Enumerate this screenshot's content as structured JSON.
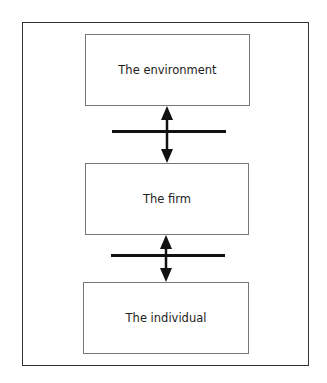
{
  "diagram": {
    "boxes": [
      {
        "label": "The environment"
      },
      {
        "label": "The firm"
      },
      {
        "label": "The individual"
      }
    ],
    "connectors": [
      {
        "from": "The environment",
        "to": "The firm",
        "type": "bidirectional-arrow-with-barrier"
      },
      {
        "from": "The firm",
        "to": "The individual",
        "type": "bidirectional-arrow-with-barrier"
      }
    ],
    "colors": {
      "frame": "#333333",
      "box_border": "#777777",
      "arrow": "#111111",
      "text": "#222222"
    }
  }
}
